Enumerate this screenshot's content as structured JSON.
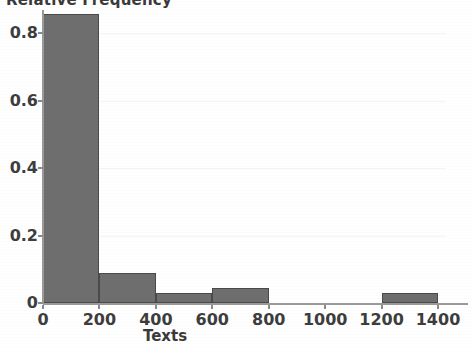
{
  "chart_data": {
    "type": "bar",
    "title": "",
    "xlabel": "Texts",
    "ylabel": "Relative Frequency",
    "grid": true,
    "legend": "none",
    "xlim": [
      0,
      1400
    ],
    "ylim": [
      0,
      0.88
    ],
    "xticks": [
      0,
      200,
      400,
      600,
      800,
      1000,
      1200,
      1400
    ],
    "xtick_labels": [
      "0",
      "200",
      "400",
      "600",
      "800",
      "1000",
      "1200",
      "1400"
    ],
    "yticks": [
      0,
      0.2,
      0.4,
      0.6,
      0.8
    ],
    "ytick_labels": [
      "0",
      "0.2",
      "0.4",
      "0.6",
      "0.8"
    ],
    "bin_width": 200,
    "bars": [
      {
        "bin_start": 0,
        "bin_end": 200,
        "value": 0.855
      },
      {
        "bin_start": 200,
        "bin_end": 400,
        "value": 0.09
      },
      {
        "bin_start": 400,
        "bin_end": 600,
        "value": 0.03
      },
      {
        "bin_start": 600,
        "bin_end": 800,
        "value": 0.045
      },
      {
        "bin_start": 800,
        "bin_end": 1000,
        "value": 0.0
      },
      {
        "bin_start": 1000,
        "bin_end": 1200,
        "value": 0.0
      },
      {
        "bin_start": 1200,
        "bin_end": 1400,
        "value": 0.03
      }
    ],
    "categories": [
      "0-200",
      "200-400",
      "400-600",
      "600-800",
      "800-1000",
      "1000-1200",
      "1200-1400"
    ],
    "values": [
      0.855,
      0.09,
      0.03,
      0.045,
      0.0,
      0.0,
      0.03
    ],
    "colors": {
      "bar_fill": "#6e6e6e",
      "bar_stroke": "#4a4a4a",
      "axis": "#9a9a9a",
      "text": "#3d3d3d",
      "grid": "#f4f4f4",
      "background": "#ffffff"
    }
  }
}
